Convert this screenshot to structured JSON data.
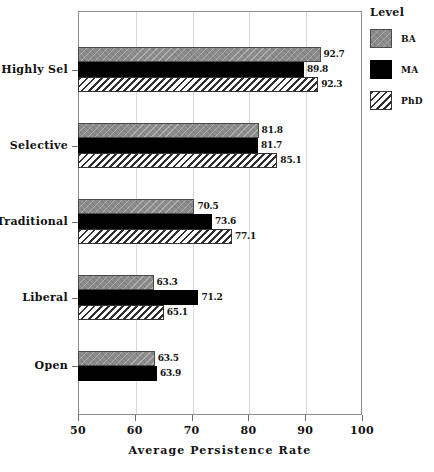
{
  "chart_data": {
    "type": "bar",
    "orientation": "horizontal",
    "title": "",
    "xlabel": "Average Persistence Rate",
    "ylabel": "",
    "xlim": [
      50,
      100
    ],
    "xticks": [
      50,
      60,
      70,
      80,
      90,
      100
    ],
    "xtick_labels": [
      "50",
      "60",
      "70",
      "80",
      "90",
      "100"
    ],
    "grid": "vertical-minor-gridlines-at-ticks",
    "categories": [
      "Highly Sel",
      "Selective",
      "Traditional",
      "Liberal",
      "Open"
    ],
    "legend": {
      "title": "Level",
      "position": "right",
      "entries": [
        {
          "name": "BA",
          "swatch": "gray-textured"
        },
        {
          "name": "MA",
          "swatch": "solid-black"
        },
        {
          "name": "PhD",
          "swatch": "diagonal-hatch"
        }
      ]
    },
    "series": [
      {
        "name": "BA",
        "values": [
          92.7,
          81.8,
          70.5,
          63.3,
          63.5
        ]
      },
      {
        "name": "MA",
        "values": [
          89.8,
          81.7,
          73.6,
          71.2,
          63.9
        ]
      },
      {
        "name": "PhD",
        "values": [
          92.3,
          85.1,
          77.1,
          65.1,
          null
        ]
      }
    ],
    "data_labels": {
      "Highly Sel": {
        "BA": "92.7",
        "MA": "89.8",
        "PhD": "92.3"
      },
      "Selective": {
        "BA": "81.8",
        "MA": "81.7",
        "PhD": "85.1"
      },
      "Traditional": {
        "BA": "70.5",
        "MA": "73.6",
        "PhD": "77.1"
      },
      "Liberal": {
        "BA": "63.3",
        "MA": "71.2",
        "PhD": "65.1"
      },
      "Open": {
        "BA": "63.5",
        "MA": "63.9",
        "PhD": ""
      }
    }
  },
  "colors": {
    "ba": "#8d8d8d",
    "ma": "#000000",
    "phd_hatch": "#2f2f2f",
    "axis": "#6f6f6f",
    "frame": "#8c8c8c",
    "grid": "#d8d8d8",
    "text": "#111111"
  }
}
